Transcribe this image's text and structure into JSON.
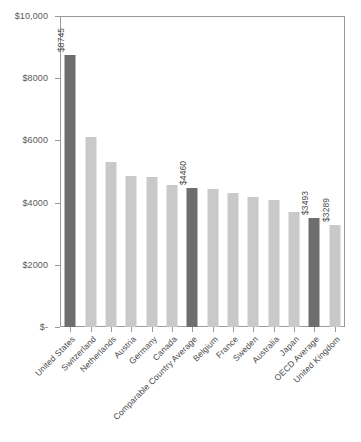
{
  "chart_data": {
    "type": "bar",
    "title": "",
    "subtitle": "",
    "xlabel": "",
    "ylabel": "",
    "ylim": [
      0,
      10000
    ],
    "grid": false,
    "legend": "none",
    "orientation": "vertical",
    "categories": [
      "United States",
      "Switzerland",
      "Netherlands",
      "Austria",
      "Germany",
      "Canada",
      "Comparable Country Average",
      "Belgium",
      "France",
      "Sweden",
      "Australia",
      "Japan",
      "OECD Average",
      "United Kingdom"
    ],
    "values": [
      8745,
      6100,
      5300,
      4840,
      4810,
      4580,
      4460,
      4440,
      4320,
      4170,
      4080,
      3700,
      3493,
      3289
    ],
    "value_labels": [
      "$8745",
      "",
      "",
      "",
      "",
      "",
      "$4460",
      "",
      "",
      "",
      "",
      "",
      "$3493",
      "$3289"
    ],
    "highlighted": [
      true,
      false,
      false,
      false,
      false,
      false,
      true,
      false,
      false,
      false,
      false,
      false,
      true,
      false
    ],
    "ytick_labels": [
      "$10,000",
      "$8000",
      "$6000",
      "$4000",
      "$2000",
      "$-"
    ],
    "ytick_values": [
      10000,
      8000,
      6000,
      4000,
      2000,
      0
    ],
    "colors": {
      "bar_light": "#c9c9c9",
      "bar_dark": "#6e6e6e",
      "axis": "#9a9a9a",
      "text": "#4a4a4a",
      "background": "#ffffff"
    }
  }
}
